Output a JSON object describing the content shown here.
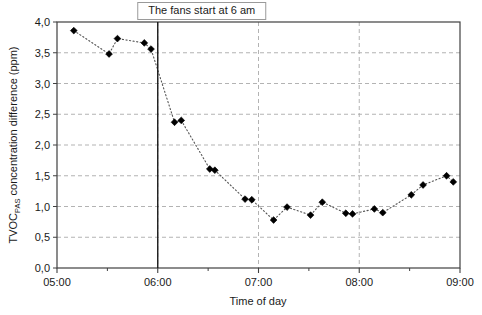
{
  "chart_data": {
    "type": "scatter",
    "title": "",
    "xlabel": "Time of day",
    "ylabel": "TVOC",
    "ylabel_sub": "PAS",
    "ylabel_rest": " concentration difference (ppm)",
    "ylim": [
      0.0,
      4.0
    ],
    "xlim": [
      "05:00",
      "09:00"
    ],
    "grid": true,
    "legend": "none",
    "x_tick_labels": [
      "05:00",
      "06:00",
      "07:00",
      "08:00",
      "09:00"
    ],
    "y_tick_labels": [
      "0,0",
      "0,5",
      "1,0",
      "1,5",
      "2,0",
      "2,5",
      "3,0",
      "3,5",
      "4,0"
    ],
    "y_tick_values": [
      0.0,
      0.5,
      1.0,
      1.5,
      2.0,
      2.5,
      3.0,
      3.5,
      4.0
    ],
    "x_minor_ticks": [
      "05:30",
      "06:30",
      "07:30",
      "08:30"
    ],
    "series": [
      {
        "name": "TVOC_PAS concentration difference",
        "marker": "filled-diamond",
        "marker_color": "#000000",
        "line": "dotted",
        "line_color": "#555555",
        "points": [
          {
            "t": "05:10",
            "v": 3.86
          },
          {
            "t": "05:31",
            "v": 3.48
          },
          {
            "t": "05:36",
            "v": 3.73
          },
          {
            "t": "05:52",
            "v": 3.66
          },
          {
            "t": "05:56",
            "v": 3.56
          },
          {
            "t": "06:10",
            "v": 2.37
          },
          {
            "t": "06:14",
            "v": 2.4
          },
          {
            "t": "06:31",
            "v": 1.61
          },
          {
            "t": "06:34",
            "v": 1.59
          },
          {
            "t": "06:52",
            "v": 1.12
          },
          {
            "t": "06:56",
            "v": 1.11
          },
          {
            "t": "07:09",
            "v": 0.78
          },
          {
            "t": "07:17",
            "v": 0.99
          },
          {
            "t": "07:31",
            "v": 0.86
          },
          {
            "t": "07:38",
            "v": 1.07
          },
          {
            "t": "07:52",
            "v": 0.89
          },
          {
            "t": "07:56",
            "v": 0.88
          },
          {
            "t": "08:09",
            "v": 0.96
          },
          {
            "t": "08:14",
            "v": 0.9
          },
          {
            "t": "08:31",
            "v": 1.19
          },
          {
            "t": "08:38",
            "v": 1.35
          },
          {
            "t": "08:52",
            "v": 1.5
          },
          {
            "t": "08:56",
            "v": 1.4
          }
        ]
      }
    ],
    "annotations": [
      {
        "label": "The fans start at 6 am",
        "x": "06:00",
        "type": "vertical-line-with-boxed-label"
      }
    ]
  },
  "colors": {
    "plot_border": "#404040",
    "gridline": "#aaaaaa",
    "marker": "#000000",
    "trend_line": "#666666",
    "event_line": "#1a1a1a",
    "text": "#1a1a1a",
    "background": "#ffffff"
  }
}
